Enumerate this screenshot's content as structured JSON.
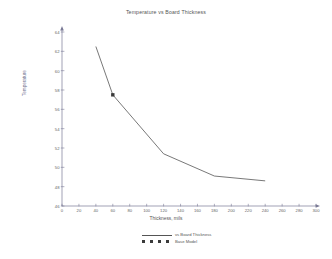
{
  "chart_data": {
    "type": "line",
    "title": "Temperature vs Board Thickness",
    "xlabel": "Thickness, mils",
    "ylabel": "Temperature",
    "xlim": [
      0,
      300
    ],
    "ylim": [
      46,
      64
    ],
    "grid": false,
    "legend_position": "bottom-center",
    "x_ticks": [
      0,
      20,
      40,
      60,
      80,
      100,
      120,
      140,
      160,
      180,
      200,
      220,
      240,
      260,
      280,
      300
    ],
    "y_ticks": [
      46,
      48,
      50,
      52,
      54,
      56,
      58,
      60,
      62,
      64
    ],
    "series": [
      {
        "name": "vs Board Thickness",
        "style": "solid-line",
        "x": [
          40,
          60,
          120,
          180,
          240
        ],
        "values": [
          62.5,
          57.5,
          51.4,
          49.1,
          48.6
        ]
      },
      {
        "name": "Base Model",
        "style": "square-marker",
        "x": [
          60
        ],
        "values": [
          57.5
        ]
      }
    ]
  },
  "legend": {
    "entries": [
      {
        "label": "vs Board Thickness",
        "key": "solid-line"
      },
      {
        "label": "Base Model",
        "key": "square-marker"
      }
    ]
  },
  "colors": {
    "line": "#555555",
    "marker": "#3a3a3a",
    "axis": "#7a7a96",
    "text": "#555555",
    "background": "#ffffff"
  }
}
